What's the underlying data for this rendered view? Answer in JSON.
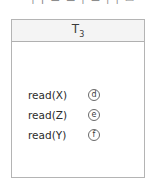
{
  "top_clipped_text": "· ¦ ¡ ▬ ▬ ¦ ▬ ¦ ¦ ▭",
  "transaction": {
    "title_letter": "T",
    "title_subscript": "3",
    "operations": [
      {
        "label": "read(X)",
        "marker": "d"
      },
      {
        "label": "read(Z)",
        "marker": "e"
      },
      {
        "label": "read(Y)",
        "marker": "f"
      }
    ]
  },
  "colors": {
    "header_bg": "#f4f4f4",
    "border": "#b4b4b4",
    "text": "#2b2b2b",
    "marker_border": "#6a6a6a"
  }
}
